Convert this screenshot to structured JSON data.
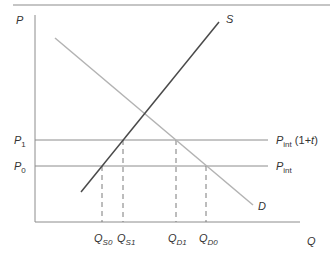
{
  "diagram": {
    "type": "supply-demand-tariff",
    "colors": {
      "axis": "#8c8c8c",
      "supply": "#4a4a4a",
      "demand": "#b3b3b3",
      "price_lines": "#8c8c8c",
      "dashed": "#7a7a7a",
      "text": "#333333",
      "top_rule": "#8c8c8c"
    },
    "axes": {
      "y_label": "P",
      "x_label": "Q"
    },
    "curves": {
      "supply": {
        "label": "S"
      },
      "demand": {
        "label": "D"
      }
    },
    "price_levels": [
      {
        "left_label_main": "P",
        "left_label_sub": "1",
        "right_label_main": "P",
        "right_label_sub": "int",
        "right_label_suffix_pre": " (1+",
        "right_label_suffix_var": "t",
        "right_label_suffix_post": ")"
      },
      {
        "left_label_main": "P",
        "left_label_sub": "0",
        "right_label_main": "P",
        "right_label_sub": "int"
      }
    ],
    "quantities": [
      {
        "main": "Q",
        "sub": "S0"
      },
      {
        "main": "Q",
        "sub": "S1"
      },
      {
        "main": "Q",
        "sub": "D1"
      },
      {
        "main": "Q",
        "sub": "D0"
      }
    ]
  }
}
